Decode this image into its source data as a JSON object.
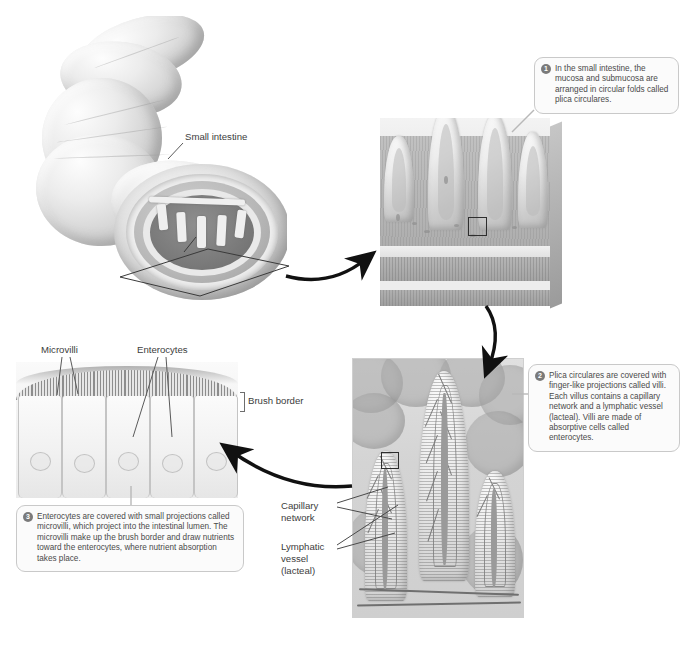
{
  "labels": {
    "small_intestine": "Small intestine",
    "microvilli": "Microvilli",
    "enterocytes": "Enterocytes",
    "brush_border": "Brush border",
    "capillary_network": "Capillary\nnetwork",
    "capillary_network_line1": "Capillary",
    "capillary_network_line2": "network",
    "lymphatic_line1": "Lymphatic",
    "lymphatic_line2": "vessel",
    "lymphatic_line3": "(lacteal)"
  },
  "callouts": [
    {
      "number": "1",
      "text": "In the small intestine, the mucosa and submucosa are arranged in circular folds called plica circulares."
    },
    {
      "number": "2",
      "text": "Plica circulares are covered with finger-like projections called villi. Each villus contains a capillary network and a lymphatic vessel (lacteal). Villi are made of absorptive cells called enterocytes."
    },
    {
      "number": "3",
      "text": "Enterocytes are covered with small projections called microvilli, which project into the intestinal lumen. The microvilli make up the brush border and draw nutrients toward the enterocytes, where nutrient absorption takes place."
    }
  ],
  "colors": {
    "ink": "#3b3b3b",
    "callout_border": "#c9c9c9",
    "callout_bg": "#fbfbfb",
    "badge": "#7a7a7a",
    "arrow": "#111111",
    "background": "#ffffff"
  }
}
